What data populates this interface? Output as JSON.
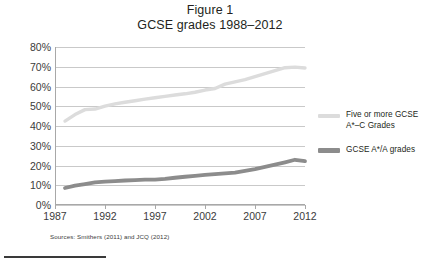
{
  "figure": {
    "title_line1": "Figure 1",
    "title_line2": "GCSE grades 1988–2012",
    "source_note": "Sources: Smithers (2011) and JCQ (2012)"
  },
  "colors": {
    "series_light": "#dcdcdc",
    "series_dark": "#8c8c8c",
    "gridline": "#c9c9c9",
    "axis": "#a8a8a8",
    "text": "#231f20",
    "rule": "#3a3a3a"
  },
  "legend": {
    "position": "right",
    "entries": [
      {
        "label_line1": "Five or more GCSE",
        "label_line2": "A*–C Grades",
        "color": "#dcdcdc"
      },
      {
        "label_line1": "GCSE A*/A grades",
        "label_line2": "",
        "color": "#8c8c8c"
      }
    ]
  },
  "chart_data": {
    "type": "line",
    "xlabel": "",
    "ylabel": "",
    "xlim": [
      1987,
      2012
    ],
    "ylim": [
      0,
      80
    ],
    "ytick_labels": [
      "80%",
      "70%",
      "60%",
      "50%",
      "40%",
      "30%",
      "20%",
      "10%",
      "0%"
    ],
    "ytick_values": [
      80,
      70,
      60,
      50,
      40,
      30,
      20,
      10,
      0
    ],
    "xtick_labels": [
      "1987",
      "1992",
      "1997",
      "2002",
      "2007",
      "2012"
    ],
    "xtick_values": [
      1987,
      1992,
      1997,
      2002,
      2007,
      2012
    ],
    "grid": "horizontal",
    "x": [
      1988,
      1989,
      1990,
      1991,
      1992,
      1993,
      1994,
      1995,
      1996,
      1997,
      1998,
      1999,
      2000,
      2001,
      2002,
      2003,
      2004,
      2005,
      2006,
      2007,
      2008,
      2009,
      2010,
      2011,
      2012
    ],
    "series": [
      {
        "name": "Five or more GCSE A*–C Grades",
        "color": "#dcdcdc",
        "values": [
          42.5,
          45.8,
          48.3,
          48.6,
          50.1,
          51.2,
          52.0,
          52.8,
          53.6,
          54.3,
          55.0,
          55.7,
          56.3,
          57.1,
          58.2,
          59.0,
          61.2,
          62.3,
          63.5,
          65.0,
          66.5,
          68.0,
          69.5,
          69.8,
          69.4
        ]
      },
      {
        "name": "GCSE A*/A grades",
        "color": "#8c8c8c",
        "values": [
          8.6,
          9.8,
          10.6,
          11.4,
          11.8,
          12.1,
          12.4,
          12.6,
          12.8,
          12.8,
          13.2,
          13.8,
          14.3,
          14.7,
          15.2,
          15.6,
          16.0,
          16.4,
          17.3,
          18.2,
          19.3,
          20.4,
          21.6,
          22.9,
          22.2
        ]
      }
    ]
  }
}
